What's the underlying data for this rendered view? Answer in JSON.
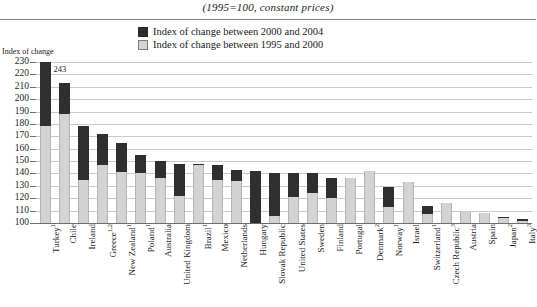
{
  "header": {
    "subtitle": "(1995=100, constant prices)"
  },
  "legend": {
    "position": "top-center",
    "items": [
      {
        "label": "Index of change between 2000 and 2004",
        "color": "#2f2f2f",
        "swatch": "dark-square-icon"
      },
      {
        "label": "Index of change between 1995 and 2000",
        "color": "#d3d3d3",
        "swatch": "light-square-icon"
      }
    ]
  },
  "axis": {
    "y_title": "Index of change",
    "ticks": [
      "230",
      "220",
      "210",
      "200",
      "190",
      "180",
      "170",
      "160",
      "150",
      "140",
      "130",
      "120",
      "110",
      "100"
    ]
  },
  "chart_data": {
    "type": "bar",
    "stacked": true,
    "title": "",
    "subtitle": "(1995=100, constant prices)",
    "xlabel": "",
    "ylabel": "Index of change",
    "ylim": [
      100,
      230
    ],
    "ytick_step": 10,
    "grid": true,
    "legend_position": "top-center",
    "categories": [
      "Turkey¹",
      "Chile",
      "Ireland",
      "Greece¹˒²",
      "New Zealand¹",
      "Poland¹",
      "Australia",
      "United Kingdom",
      "Brazil¹",
      "Mexico",
      "Netherlands",
      "Hungary",
      "Slovak Republic",
      "United States",
      "Sweden",
      "Finland",
      "Portugal",
      "Denmark²",
      "Norway¹",
      "Israel",
      "Switzerland¹",
      "Czech Republic³",
      "Austria",
      "Spain",
      "Japan²",
      "Italy³"
    ],
    "categories_plain": [
      "Turkey",
      "Chile",
      "Ireland",
      "Greece",
      "New Zealand",
      "Poland",
      "Australia",
      "United Kingdom",
      "Brazil",
      "Mexico",
      "Netherlands",
      "Hungary",
      "Slovak Republic",
      "United States",
      "Sweden",
      "Finland",
      "Portugal",
      "Denmark",
      "Norway",
      "Israel",
      "Switzerland",
      "Czech Republic",
      "Austria",
      "Spain",
      "Japan",
      "Italy"
    ],
    "footnote_markers": [
      "1",
      "",
      "",
      "1,2",
      "1",
      "1",
      "",
      "",
      "1",
      "",
      "",
      "",
      "",
      "",
      "",
      "",
      "",
      "2",
      "1",
      "",
      "1",
      "3",
      "",
      "",
      "2",
      "3"
    ],
    "series": [
      {
        "name": "Index of change between 1995 and 2000",
        "color": "#d3d3d3",
        "values": [
          178,
          188,
          135,
          147,
          141,
          140,
          136,
          122,
          147,
          135,
          134,
          100,
          106,
          121,
          124,
          120,
          136,
          142,
          113,
          133,
          107,
          116,
          110,
          108,
          104,
          102
        ]
      },
      {
        "name": "Index of change between 2000 and 2004",
        "color": "#2f2f2f",
        "values": [
          243,
          213,
          178,
          172,
          165,
          155,
          150,
          148,
          148,
          147,
          143,
          142,
          140,
          140,
          140,
          136,
          133,
          131,
          129,
          124,
          114,
          112,
          110,
          108,
          105,
          103
        ]
      }
    ],
    "totals": [
      243,
      213,
      178,
      172,
      165,
      155,
      150,
      148,
      148,
      147,
      143,
      142,
      140,
      140,
      140,
      136,
      133,
      131,
      129,
      124,
      114,
      112,
      110,
      108,
      105,
      103
    ],
    "annotations": [
      {
        "category": "Turkey¹",
        "text": "243",
        "note": "bar clipped at axis maximum 230"
      }
    ]
  }
}
